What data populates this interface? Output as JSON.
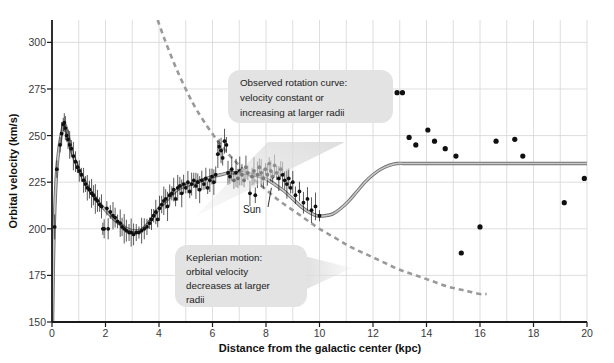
{
  "figure": {
    "title": "",
    "background": "#ffffff"
  },
  "axes": {
    "xlabel": "Distance from the galactic center (kpc)",
    "ylabel": "Orbital velocity (km/s)",
    "xticks": [
      "0",
      "2",
      "4",
      "6",
      "8",
      "10",
      "12",
      "14",
      "16",
      "18",
      "20"
    ],
    "xtick_values": [
      0,
      2,
      4,
      6,
      8,
      10,
      12,
      14,
      16,
      18,
      20
    ],
    "yticks": [
      "150",
      "175",
      "200",
      "225",
      "250",
      "275",
      "300"
    ],
    "ytick_values": [
      150,
      175,
      200,
      225,
      250,
      275,
      300
    ],
    "xlim": [
      0,
      20
    ],
    "ylim": [
      150,
      312
    ],
    "grid": true,
    "grid_color": "#d6d6d6",
    "axis_color": "#1a1a1a"
  },
  "annotations": {
    "observed": {
      "lines": [
        "Observed rotation curve:",
        "velocity constant or",
        "increasing at larger radii"
      ],
      "box_color": "#e3e3e3"
    },
    "keplerian": {
      "lines": [
        "Keplerian motion:",
        "orbital velocity",
        "decreases at larger",
        "radii"
      ],
      "box_color": "#e3e3e3"
    },
    "sun": {
      "label": "Sun",
      "x_kpc": 8.2,
      "y_kms": 222
    }
  },
  "legend": {
    "position": "none",
    "entries": []
  },
  "chart_data": {
    "type": "scatter",
    "title": "",
    "xlabel": "Distance from the galactic center (kpc)",
    "ylabel": "Orbital velocity (km/s)",
    "xlim": [
      0,
      20
    ],
    "ylim": [
      150,
      312
    ],
    "grid": true,
    "legend_position": "none",
    "series": [
      {
        "name": "Measured orbital velocities",
        "type": "scatter",
        "marker": "circle",
        "color": "#101010",
        "points": [
          [
            0.1,
            201
          ],
          [
            0.18,
            232
          ],
          [
            0.3,
            245
          ],
          [
            0.36,
            251
          ],
          [
            0.42,
            256
          ],
          [
            0.46,
            257
          ],
          [
            0.5,
            254
          ],
          [
            0.55,
            250
          ],
          [
            0.6,
            248
          ],
          [
            0.66,
            245
          ],
          [
            0.72,
            243
          ],
          [
            0.8,
            239
          ],
          [
            0.88,
            236
          ],
          [
            0.95,
            233
          ],
          [
            1.02,
            231
          ],
          [
            1.1,
            229
          ],
          [
            1.18,
            226
          ],
          [
            1.25,
            224
          ],
          [
            1.32,
            222
          ],
          [
            1.4,
            221
          ],
          [
            1.48,
            219
          ],
          [
            1.55,
            218
          ],
          [
            1.62,
            216
          ],
          [
            1.7,
            215
          ],
          [
            1.78,
            213
          ],
          [
            1.85,
            212
          ],
          [
            1.9,
            200
          ],
          [
            1.95,
            200
          ],
          [
            2.05,
            211
          ],
          [
            2.1,
            200
          ],
          [
            2.18,
            209
          ],
          [
            2.28,
            207
          ],
          [
            2.36,
            206
          ],
          [
            2.45,
            204
          ],
          [
            2.55,
            203
          ],
          [
            2.62,
            201
          ],
          [
            2.7,
            200
          ],
          [
            2.78,
            199
          ],
          [
            2.88,
            198
          ],
          [
            2.96,
            198
          ],
          [
            3.05,
            197
          ],
          [
            3.15,
            198
          ],
          [
            3.25,
            198
          ],
          [
            3.35,
            199
          ],
          [
            3.45,
            200
          ],
          [
            3.55,
            201
          ],
          [
            3.65,
            203
          ],
          [
            3.72,
            205
          ],
          [
            3.8,
            207
          ],
          [
            3.88,
            209
          ],
          [
            3.95,
            205
          ],
          [
            4.02,
            211
          ],
          [
            4.1,
            213
          ],
          [
            4.18,
            215
          ],
          [
            4.25,
            216
          ],
          [
            4.32,
            212
          ],
          [
            4.4,
            218
          ],
          [
            4.48,
            219
          ],
          [
            4.55,
            221
          ],
          [
            4.62,
            216
          ],
          [
            4.7,
            222
          ],
          [
            4.78,
            223
          ],
          [
            4.85,
            219
          ],
          [
            4.92,
            224
          ],
          [
            5.0,
            222
          ],
          [
            5.08,
            225
          ],
          [
            5.15,
            220
          ],
          [
            5.22,
            224
          ],
          [
            5.3,
            226
          ],
          [
            5.38,
            223
          ],
          [
            5.45,
            225
          ],
          [
            5.52,
            221
          ],
          [
            5.6,
            226
          ],
          [
            5.68,
            224
          ],
          [
            5.75,
            227
          ],
          [
            5.82,
            222
          ],
          [
            5.9,
            226
          ],
          [
            5.98,
            228
          ],
          [
            6.05,
            225
          ],
          [
            6.12,
            229
          ],
          [
            6.2,
            240
          ],
          [
            6.25,
            244
          ],
          [
            6.32,
            242
          ],
          [
            6.38,
            238
          ],
          [
            6.45,
            247
          ],
          [
            6.52,
            245
          ],
          [
            6.58,
            230
          ],
          [
            6.65,
            228
          ],
          [
            6.72,
            232
          ],
          [
            6.8,
            226
          ],
          [
            6.88,
            230
          ],
          [
            6.95,
            227
          ],
          [
            7.02,
            231
          ],
          [
            7.1,
            229
          ],
          [
            7.18,
            226
          ],
          [
            7.25,
            233
          ],
          [
            7.32,
            230
          ],
          [
            7.4,
            219
          ],
          [
            7.48,
            228
          ],
          [
            7.55,
            231
          ],
          [
            7.6,
            218
          ],
          [
            7.68,
            229
          ],
          [
            7.75,
            233
          ],
          [
            7.82,
            230
          ],
          [
            7.9,
            227
          ],
          [
            7.98,
            232
          ],
          [
            8.05,
            229
          ],
          [
            8.12,
            235
          ],
          [
            8.18,
            231
          ],
          [
            8.25,
            228
          ],
          [
            8.32,
            234
          ],
          [
            8.4,
            230
          ],
          [
            8.48,
            227
          ],
          [
            8.55,
            232
          ],
          [
            8.62,
            229
          ],
          [
            8.7,
            226
          ],
          [
            8.78,
            224
          ],
          [
            8.85,
            227
          ],
          [
            8.92,
            222
          ],
          [
            9.0,
            225
          ],
          [
            9.1,
            218
          ],
          [
            9.25,
            220
          ],
          [
            9.4,
            214
          ],
          [
            9.55,
            216
          ],
          [
            9.7,
            210
          ],
          [
            9.85,
            212
          ],
          [
            10.0,
            207
          ],
          [
            12.6,
            262
          ],
          [
            12.9,
            273
          ],
          [
            13.1,
            273
          ],
          [
            13.35,
            249
          ],
          [
            13.6,
            245
          ],
          [
            14.05,
            253
          ],
          [
            14.3,
            247
          ],
          [
            14.7,
            243
          ],
          [
            15.1,
            239
          ],
          [
            15.3,
            187
          ],
          [
            16.0,
            201
          ],
          [
            16.6,
            247
          ],
          [
            17.3,
            248
          ],
          [
            17.6,
            239
          ],
          [
            19.15,
            214
          ],
          [
            19.9,
            227
          ]
        ]
      },
      {
        "name": "Model rotation curve (fit to data)",
        "type": "line",
        "style": "solid",
        "color": "#8a8a8a",
        "points": [
          [
            0.02,
            150
          ],
          [
            0.05,
            180
          ],
          [
            0.08,
            200
          ],
          [
            0.12,
            216
          ],
          [
            0.18,
            232
          ],
          [
            0.26,
            243
          ],
          [
            0.34,
            250
          ],
          [
            0.42,
            255
          ],
          [
            0.48,
            256
          ],
          [
            0.55,
            253
          ],
          [
            0.65,
            247
          ],
          [
            0.75,
            241
          ],
          [
            0.85,
            237
          ],
          [
            1.0,
            232
          ],
          [
            1.2,
            226
          ],
          [
            1.4,
            221
          ],
          [
            1.6,
            217
          ],
          [
            1.8,
            213
          ],
          [
            2.0,
            210
          ],
          [
            2.2,
            207
          ],
          [
            2.4,
            204
          ],
          [
            2.6,
            202
          ],
          [
            2.8,
            200
          ],
          [
            3.0,
            199
          ],
          [
            3.2,
            199
          ],
          [
            3.4,
            200
          ],
          [
            3.6,
            203
          ],
          [
            3.8,
            207
          ],
          [
            4.0,
            211
          ],
          [
            4.2,
            214
          ],
          [
            4.4,
            217
          ],
          [
            4.6,
            220
          ],
          [
            4.8,
            222
          ],
          [
            5.0,
            223
          ],
          [
            5.2,
            224
          ],
          [
            5.4,
            225
          ],
          [
            5.6,
            226
          ],
          [
            5.8,
            227
          ],
          [
            6.0,
            228
          ],
          [
            6.3,
            229
          ],
          [
            6.6,
            230
          ],
          [
            6.9,
            230
          ],
          [
            7.2,
            230
          ],
          [
            7.5,
            229
          ],
          [
            7.8,
            228
          ],
          [
            8.1,
            226
          ],
          [
            8.4,
            223
          ],
          [
            8.7,
            220
          ],
          [
            9.0,
            216
          ],
          [
            9.3,
            212
          ],
          [
            9.6,
            209
          ],
          [
            9.9,
            207
          ],
          [
            10.2,
            207
          ],
          [
            10.5,
            208
          ],
          [
            10.8,
            211
          ],
          [
            11.1,
            215
          ],
          [
            11.4,
            220
          ],
          [
            11.7,
            225
          ],
          [
            12.0,
            229
          ],
          [
            12.3,
            232
          ],
          [
            12.6,
            234
          ],
          [
            12.9,
            235
          ],
          [
            13.3,
            235
          ],
          [
            14.0,
            235
          ],
          [
            15.0,
            235
          ],
          [
            16.0,
            235
          ],
          [
            17.0,
            235
          ],
          [
            18.0,
            235
          ],
          [
            19.0,
            235
          ],
          [
            20.0,
            235
          ]
        ]
      },
      {
        "name": "Keplerian motion (predicted)",
        "type": "line",
        "style": "dashed",
        "color": "#9a9a9a",
        "points": [
          [
            3.95,
            312
          ],
          [
            4.2,
            302
          ],
          [
            4.5,
            291
          ],
          [
            4.8,
            281
          ],
          [
            5.1,
            272
          ],
          [
            5.4,
            264
          ],
          [
            5.8,
            255
          ],
          [
            6.2,
            247
          ],
          [
            6.6,
            240
          ],
          [
            7.0,
            234
          ],
          [
            7.5,
            227
          ],
          [
            8.0,
            221
          ],
          [
            8.5,
            215
          ],
          [
            9.0,
            210
          ],
          [
            9.5,
            205
          ],
          [
            10.0,
            200
          ],
          [
            10.6,
            195
          ],
          [
            11.2,
            190
          ],
          [
            11.8,
            186
          ],
          [
            12.4,
            182
          ],
          [
            13.0,
            178
          ],
          [
            13.6,
            175
          ],
          [
            14.2,
            172
          ],
          [
            14.8,
            169
          ],
          [
            15.4,
            167
          ],
          [
            16.0,
            165
          ],
          [
            16.25,
            165
          ]
        ]
      }
    ]
  }
}
